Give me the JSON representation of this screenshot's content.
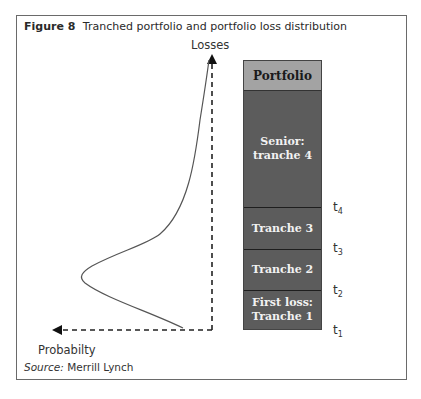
{
  "figure": {
    "label": "Figure 8",
    "title": "Tranched portfolio and portfolio loss distribution",
    "source_label": "Source:",
    "source_value": "Merrill Lynch"
  },
  "axes": {
    "y_label": "Losses",
    "x_label": "Probabilty"
  },
  "portfolio": {
    "header": "Portfolio",
    "tranches": [
      {
        "line1": "Senior:",
        "line2": "tranche 4"
      },
      {
        "line1": "Tranche 3",
        "line2": ""
      },
      {
        "line1": "Tranche 2",
        "line2": ""
      },
      {
        "line1": "First loss:",
        "line2": "Tranche 1"
      }
    ],
    "thresholds": [
      {
        "base": "t",
        "sub": "4"
      },
      {
        "base": "t",
        "sub": "3"
      },
      {
        "base": "t",
        "sub": "2"
      },
      {
        "base": "t",
        "sub": "1"
      }
    ]
  },
  "colors": {
    "header_fill": "#a3a3a3",
    "tranche_fill": "#5c5c5c",
    "curve": "#555555",
    "axis": "#222222"
  }
}
